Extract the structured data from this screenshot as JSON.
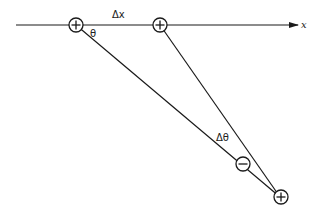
{
  "diagram": {
    "axis_label": "x",
    "delta_x_label": "Δx",
    "theta_label": "θ",
    "delta_theta_label": "Δθ",
    "charges": [
      {
        "id": "charge-left",
        "sign": "+"
      },
      {
        "id": "charge-right",
        "sign": "+"
      },
      {
        "id": "image-minus",
        "sign": "−"
      },
      {
        "id": "image-plus",
        "sign": "+"
      }
    ],
    "colors": {
      "stroke": "#1a1a1a",
      "background": "#ffffff"
    }
  }
}
